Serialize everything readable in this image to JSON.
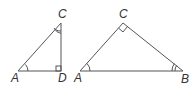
{
  "diagram": {
    "left_triangle": {
      "vertices": {
        "A": "A",
        "D": "D",
        "C": "C"
      },
      "marks": [
        "angle-A single arc",
        "angle-C double arc",
        "right angle at D"
      ]
    },
    "right_triangle": {
      "vertices": {
        "A": "A",
        "B": "B",
        "C": "C"
      },
      "marks": [
        "angle-A single arc",
        "angle-B double arc",
        "right angle at C"
      ]
    },
    "colors": {
      "stroke": "#555555",
      "label": "#333333"
    }
  }
}
